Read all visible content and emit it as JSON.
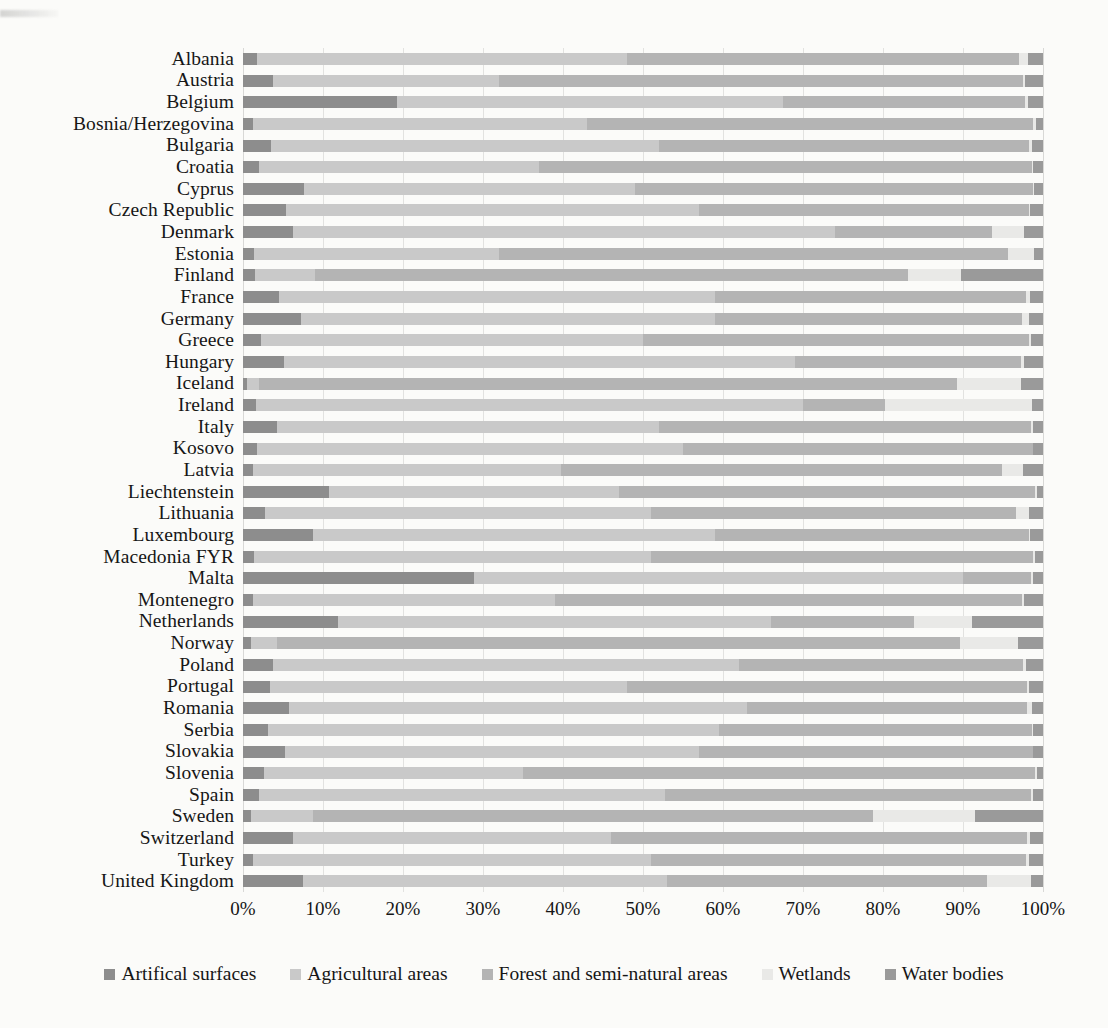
{
  "chart_data": {
    "type": "bar",
    "subtype": "stacked-horizontal-100percent",
    "title": "",
    "xlabel": "",
    "ylabel": "",
    "xlim": [
      0,
      100
    ],
    "xticks": [
      "0%",
      "10%",
      "20%",
      "30%",
      "40%",
      "50%",
      "60%",
      "70%",
      "80%",
      "90%",
      "100%"
    ],
    "xtick_values": [
      0,
      10,
      20,
      30,
      40,
      50,
      60,
      70,
      80,
      90,
      100
    ],
    "grid": true,
    "grid_axis": "x",
    "legend_position": "bottom",
    "legend": [
      "Artifical surfaces",
      "Agricultural areas",
      "Forest and semi-natural areas",
      "Wetlands",
      "Water bodies"
    ],
    "series_colors": [
      "#8d8d8d",
      "#c9c9c9",
      "#b4b4b4",
      "#e9e9e7",
      "#9a9a9a"
    ],
    "categories": [
      "Albania",
      "Austria",
      "Belgium",
      "Bosnia/Herzegovina",
      "Bulgaria",
      "Croatia",
      "Cyprus",
      "Czech Republic",
      "Denmark",
      "Estonia",
      "Finland",
      "France",
      "Germany",
      "Greece",
      "Hungary",
      "Iceland",
      "Ireland",
      "Italy",
      "Kosovo",
      "Latvia",
      "Liechtenstein",
      "Lithuania",
      "Luxembourg",
      "Macedonia FYR",
      "Malta",
      "Montenegro",
      "Netherlands",
      "Norway",
      "Poland",
      "Portugal",
      "Romania",
      "Serbia",
      "Slovakia",
      "Slovenia",
      "Spain",
      "Sweden",
      "Switzerland",
      "Turkey",
      "United Kingdom"
    ],
    "series": [
      {
        "name": "Artifical surfaces",
        "values": [
          1.7,
          3.8,
          19.2,
          1.3,
          3.5,
          2.0,
          7.6,
          5.4,
          6.2,
          1.4,
          1.5,
          4.5,
          7.3,
          2.2,
          5.1,
          0.5,
          1.6,
          4.3,
          1.8,
          1.2,
          10.8,
          2.7,
          8.7,
          1.4,
          28.9,
          1.3,
          11.9,
          1.0,
          3.8,
          3.4,
          5.7,
          3.1,
          5.2,
          2.6,
          2.0,
          1.0,
          6.2,
          1.3,
          7.5
        ]
      },
      {
        "name": "Agricultural areas",
        "values": [
          46.3,
          28.2,
          48.3,
          41.7,
          48.5,
          35.0,
          41.4,
          51.6,
          67.8,
          30.6,
          7.5,
          54.5,
          51.7,
          47.8,
          63.9,
          1.5,
          68.4,
          47.7,
          53.2,
          38.5,
          36.2,
          48.3,
          50.3,
          49.6,
          61.1,
          37.7,
          54.1,
          3.3,
          58.2,
          44.6,
          57.3,
          56.4,
          51.8,
          32.4,
          50.8,
          7.8,
          39.8,
          49.7,
          45.5
        ]
      },
      {
        "name": "Forest and semi-natural areas",
        "values": [
          49.0,
          65.5,
          30.2,
          55.8,
          46.2,
          61.6,
          49.7,
          41.3,
          19.6,
          63.6,
          74.1,
          38.9,
          38.4,
          48.3,
          28.3,
          87.2,
          10.2,
          46.5,
          43.7,
          55.2,
          52.0,
          45.6,
          39.2,
          47.8,
          8.5,
          58.4,
          17.9,
          85.3,
          35.5,
          50.0,
          35.0,
          39.1,
          41.7,
          64.0,
          45.7,
          69.9,
          52.0,
          46.9,
          40.0
        ]
      },
      {
        "name": "Wetlands",
        "values": [
          1.1,
          0.2,
          0.4,
          0.3,
          0.4,
          0.2,
          0.2,
          0.1,
          4.0,
          3.3,
          6.7,
          0.5,
          0.9,
          0.2,
          0.3,
          8.0,
          18.4,
          0.2,
          0.1,
          2.6,
          0.2,
          1.7,
          0.2,
          0.2,
          0.2,
          0.2,
          7.2,
          7.3,
          0.4,
          0.3,
          0.6,
          0.2,
          0.1,
          0.2,
          0.2,
          12.8,
          0.4,
          0.4,
          5.5
        ]
      },
      {
        "name": "Water bodies",
        "values": [
          1.9,
          2.3,
          1.9,
          0.9,
          1.4,
          1.2,
          1.1,
          1.6,
          2.4,
          1.1,
          10.2,
          1.6,
          1.7,
          1.5,
          2.4,
          2.8,
          1.4,
          1.3,
          1.2,
          2.5,
          0.8,
          1.7,
          1.6,
          1.0,
          1.3,
          2.4,
          8.9,
          3.1,
          2.1,
          1.7,
          1.4,
          1.2,
          1.2,
          0.8,
          1.3,
          8.5,
          1.6,
          1.7,
          1.5
        ]
      }
    ]
  }
}
